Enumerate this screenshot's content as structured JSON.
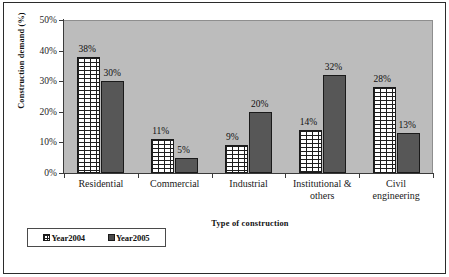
{
  "chart_data": {
    "type": "bar",
    "title": "",
    "xlabel": "Type of construction",
    "ylabel": "Construction demand (%)",
    "categories": [
      "Residential",
      "Commercial",
      "Industrial",
      "Institutional & others",
      "Civil engineering"
    ],
    "category_lines": [
      [
        "Residential"
      ],
      [
        "Commercial"
      ],
      [
        "Industrial"
      ],
      [
        "Institutional &",
        "others"
      ],
      [
        "Civil",
        "engineering"
      ]
    ],
    "series": [
      {
        "name": "Year2004",
        "values": [
          38,
          11,
          9,
          14,
          28
        ],
        "color": "#ffffff",
        "pattern": "brick"
      },
      {
        "name": "Year2005",
        "values": [
          30,
          5,
          20,
          32,
          13
        ],
        "color": "#575757",
        "pattern": "solid"
      }
    ],
    "value_labels": [
      [
        "38%",
        "30%"
      ],
      [
        "11%",
        "5%"
      ],
      [
        "9%",
        "20%"
      ],
      [
        "14%",
        "32%"
      ],
      [
        "28%",
        "13%"
      ]
    ],
    "ylim": [
      0,
      50
    ],
    "ytick_labels": [
      "0%",
      "10%",
      "20%",
      "30%",
      "40%",
      "50%"
    ],
    "ytick_values": [
      0,
      10,
      20,
      30,
      40,
      50
    ],
    "grid": false,
    "legend_position": "bottom-left",
    "plot_background": "#bcbcbc"
  },
  "legend": {
    "entries": [
      {
        "label": "Year2004"
      },
      {
        "label": "Year2005"
      }
    ]
  }
}
